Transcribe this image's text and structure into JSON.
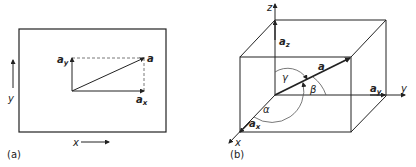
{
  "figure": {
    "panels": [
      {
        "id": "a",
        "caption": "(a)",
        "type": "2D vector decomposition",
        "labels": {
          "vector": "a",
          "component_x": "a",
          "component_x_sub": "x",
          "component_y": "a",
          "component_y_sub": "y",
          "axis_x": "x",
          "axis_y": "y"
        }
      },
      {
        "id": "b",
        "caption": "(b)",
        "type": "3D vector decomposition with direction angles",
        "labels": {
          "vector": "a",
          "component_x": "a",
          "component_x_sub": "x",
          "component_y": "a",
          "component_y_sub": "y",
          "component_z": "a",
          "component_z_sub": "z",
          "axis_x": "x",
          "axis_y": "y",
          "axis_z": "z",
          "angle_alpha": "α",
          "angle_beta": "β",
          "angle_gamma": "γ"
        }
      }
    ],
    "colors": {
      "line": "#222222",
      "dashed": "#555555",
      "background": "#ffffff"
    }
  }
}
